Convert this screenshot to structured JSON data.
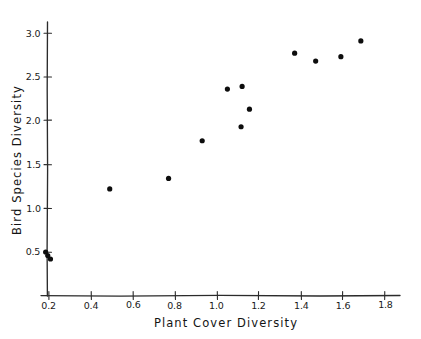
{
  "chart_data": {
    "type": "scatter",
    "title": "",
    "xlabel": "Plant Cover Diversity",
    "ylabel": "Bird Species Diversity",
    "xlim": [
      0.15,
      1.9
    ],
    "ylim": [
      0.28,
      3.16
    ],
    "grid": false,
    "legend": null,
    "marker": {
      "shape": "filled-circle",
      "color": "#0d0d0d",
      "size_px": 5.2
    },
    "style": "hand-drawn",
    "xticks": [
      0.2,
      0.4,
      0.6,
      0.8,
      1.0,
      1.2,
      1.4,
      1.6,
      1.8
    ],
    "xticklabels": [
      "0.2",
      "0.4",
      "0.6",
      "0.8",
      "1.0",
      "1.2",
      "1.4",
      "1.6",
      "1.8"
    ],
    "yticks": [
      0.5,
      1.0,
      1.5,
      2.0,
      2.5,
      3.0
    ],
    "yticklabels": [
      "0.5",
      "1.0",
      "1.5",
      "2.0",
      "2.5",
      "3.0"
    ],
    "n_points": 13,
    "points": [
      {
        "x": 0.185,
        "y": 0.5
      },
      {
        "x": 0.195,
        "y": 0.46
      },
      {
        "x": 0.208,
        "y": 0.42
      },
      {
        "x": 0.49,
        "y": 1.22
      },
      {
        "x": 0.77,
        "y": 1.34
      },
      {
        "x": 0.93,
        "y": 1.77
      },
      {
        "x": 1.05,
        "y": 2.36
      },
      {
        "x": 1.12,
        "y": 2.39
      },
      {
        "x": 1.115,
        "y": 1.93
      },
      {
        "x": 1.155,
        "y": 2.13
      },
      {
        "x": 1.37,
        "y": 2.77
      },
      {
        "x": 1.47,
        "y": 2.68
      },
      {
        "x": 1.59,
        "y": 2.73
      },
      {
        "x": 1.685,
        "y": 2.91
      }
    ]
  },
  "axes": {
    "x_title": "Plant Cover Diversity",
    "y_title": "Bird Species Diversity"
  }
}
